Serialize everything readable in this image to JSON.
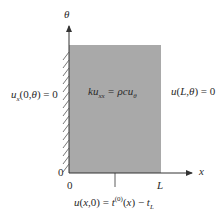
{
  "diagram": {
    "axes": {
      "vertical_label": "θ",
      "horizontal_label": "x",
      "origin_x_tick": "0",
      "origin_y_tick": "0",
      "x_end_tick": "L"
    },
    "domain_fill_color": "#a9a9a9",
    "equation": "ku_xx = ρcu_θ",
    "boundary_conditions": {
      "left": "u_x(0,θ) = 0",
      "right": "u(L,θ) = 0",
      "bottom": "u(x,0) = t^(0)(x) − t_L"
    }
  }
}
